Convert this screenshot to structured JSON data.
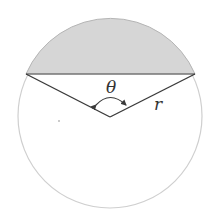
{
  "diagram": {
    "labels": {
      "angle": "θ",
      "radius": "r"
    },
    "colors": {
      "background": "#ffffff",
      "segment_fill": "#d6d6d6",
      "circle_stroke": "#cfcfcf",
      "line_stroke": "#3a3a3a",
      "text": "#333333"
    },
    "geometry": {
      "circle": {
        "cx": 110,
        "cy": 116,
        "r": 92
      },
      "chord": {
        "x1": 26,
        "y1": 74,
        "x2": 195,
        "y2": 74
      },
      "vertex": {
        "x": 110,
        "y": 117
      }
    }
  }
}
